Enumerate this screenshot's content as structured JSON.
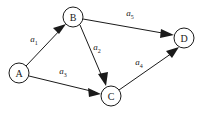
{
  "diagram": {
    "type": "directed-graph",
    "title": "",
    "background_color": "#ffffff",
    "stroke_color": "#1a1a1a",
    "nodes": [
      {
        "id": "A",
        "label": "A",
        "x": 19,
        "y": 73,
        "r": 10
      },
      {
        "id": "B",
        "label": "B",
        "x": 73,
        "y": 17,
        "r": 10
      },
      {
        "id": "C",
        "label": "C",
        "x": 111,
        "y": 96,
        "r": 10
      },
      {
        "id": "D",
        "label": "D",
        "x": 184,
        "y": 38,
        "r": 10
      }
    ],
    "edges": [
      {
        "id": "e1",
        "from": "A",
        "to": "B",
        "label_base": "a",
        "label_sub": "1",
        "label_x": 34,
        "label_y": 42,
        "x1": 26,
        "y1": 66,
        "x2": 66,
        "y2": 24,
        "directed": true
      },
      {
        "id": "e2",
        "from": "B",
        "to": "C",
        "label_base": "a",
        "label_sub": "2",
        "label_x": 97,
        "label_y": 50,
        "x1": 80,
        "y1": 25,
        "x2": 106,
        "y2": 86,
        "directed": true
      },
      {
        "id": "e3",
        "from": "A",
        "to": "C",
        "label_base": "a",
        "label_sub": "3",
        "label_x": 63,
        "label_y": 74,
        "x1": 29,
        "y1": 76,
        "x2": 101,
        "y2": 94,
        "directed": true
      },
      {
        "id": "e4",
        "from": "C",
        "to": "D",
        "label_base": "a",
        "label_sub": "4",
        "label_x": 139,
        "label_y": 65,
        "x1": 119,
        "y1": 90,
        "x2": 179,
        "y2": 47,
        "directed": true
      },
      {
        "id": "e5",
        "from": "B",
        "to": "D",
        "label_base": "a",
        "label_sub": "5",
        "label_x": 130,
        "label_y": 16,
        "x1": 83,
        "y1": 19,
        "x2": 174,
        "y2": 35,
        "directed": true
      }
    ]
  }
}
